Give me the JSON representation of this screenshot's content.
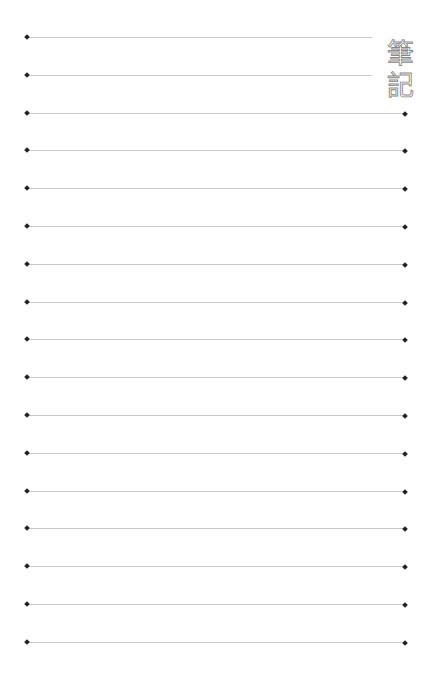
{
  "page": {
    "title_chars": [
      "筆",
      "記"
    ],
    "colors": {
      "line": "#c9c9c9",
      "dot": "#222222",
      "title_outline": "#888888"
    },
    "lines": {
      "count": 17,
      "first_y": 37,
      "spacing": 37.8,
      "left_x": 27,
      "right_x": 405,
      "short_right_x": 372,
      "short_line_count": 2
    }
  }
}
